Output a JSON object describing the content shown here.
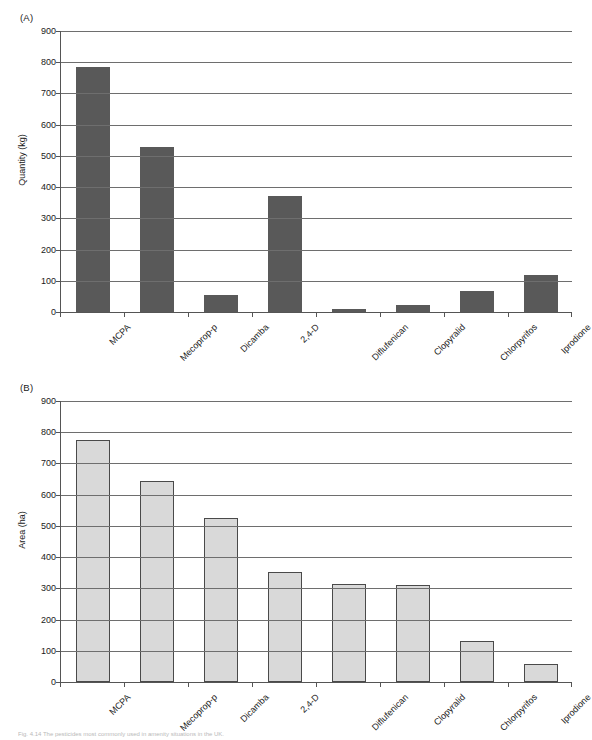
{
  "figure": {
    "caption": "Fig. 4.14  The pesticides most commonly used in amenity situations in the UK."
  },
  "panels": [
    {
      "key": "a",
      "label": "(A)",
      "bar_color": "#595959",
      "bar_border": "none"
    },
    {
      "key": "b",
      "label": "(B)",
      "bar_color": "#d9d9d9",
      "bar_border": "#4a4a4a"
    }
  ],
  "chart_data": [
    {
      "type": "bar",
      "panel": "(A)",
      "title": "",
      "xlabel": "",
      "ylabel": "Quantity (kg)",
      "ylim": [
        0,
        900
      ],
      "ytick_step": 100,
      "yticks": [
        0,
        100,
        200,
        300,
        400,
        500,
        600,
        700,
        800,
        900
      ],
      "grid": "horizontal",
      "legend": "none",
      "bar_color": "#595959",
      "categories": [
        "MCPA",
        "Mecoprop-p",
        "Dicamba",
        "2,4-D",
        "Diflufenican",
        "Clopyralid",
        "Chlorpyrifos",
        "Iprodione"
      ],
      "values": [
        785,
        527,
        56,
        372,
        11,
        22,
        68,
        120
      ]
    },
    {
      "type": "bar",
      "panel": "(B)",
      "title": "",
      "xlabel": "",
      "ylabel": "Area (ha)",
      "ylim": [
        0,
        900
      ],
      "ytick_step": 100,
      "yticks": [
        0,
        100,
        200,
        300,
        400,
        500,
        600,
        700,
        800,
        900
      ],
      "grid": "horizontal",
      "legend": "none",
      "bar_color": "#d9d9d9",
      "categories": [
        "MCPA",
        "Mecoprop-p",
        "Dicamba",
        "2,4-D",
        "Diflufenican",
        "Clopyralid",
        "Chlorpyrifos",
        "Iprodione"
      ],
      "values": [
        775,
        645,
        525,
        353,
        313,
        312,
        131,
        57
      ]
    }
  ]
}
